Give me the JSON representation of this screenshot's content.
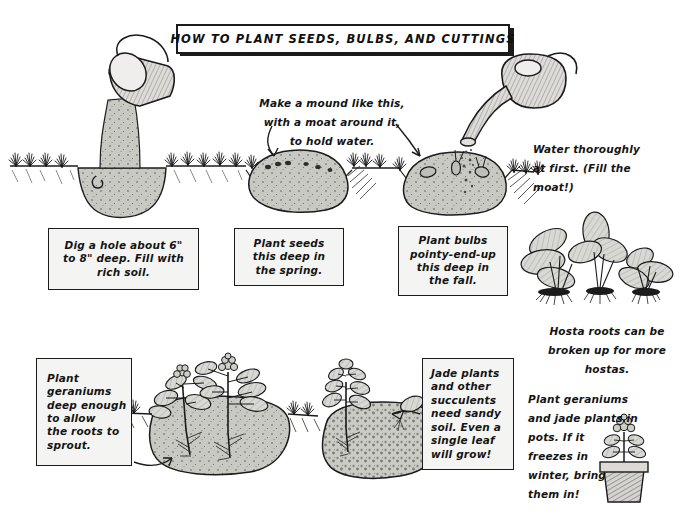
{
  "poster": {
    "title": "HOW TO PLANT SEEDS, BULBS, AND CUTTINGS",
    "background_color": "#ffffff",
    "ink_color": "#141414",
    "soil_color": "#c9c9c4",
    "box_fill": "#f4f4f2"
  },
  "top_row": {
    "captions": [
      {
        "id": "dig-hole",
        "text": "Dig a hole about 6\"\nto 8\" deep. Fill with\nrich soil."
      },
      {
        "id": "plant-seeds",
        "text": "Plant seeds\nthis deep in\nthe spring."
      },
      {
        "id": "plant-bulbs",
        "text": "Plant bulbs\npointy-end-up\nthis deep in\nthe fall."
      }
    ],
    "notes": [
      {
        "id": "make-a-mound",
        "text": "Make a mound like this,\nwith a moat around it,\nto hold water."
      },
      {
        "id": "water-thoroughly",
        "text": "Water thoroughly\nat first. (Fill the\nmoat!)"
      }
    ],
    "illustrations": [
      {
        "id": "bucket-pouring-soil-into-hole",
        "label": "bucket pouring soil into hole"
      },
      {
        "id": "seed-mound-with-moat",
        "label": "mound of soil with seeds and moat"
      },
      {
        "id": "watering-can-over-bulb-mound",
        "label": "watering can watering mound with bulbs"
      },
      {
        "id": "hosta-plants-with-roots",
        "label": "three hosta plants with exposed roots"
      }
    ]
  },
  "bottom_row": {
    "captions": [
      {
        "id": "plant-geraniums-deep",
        "text": "Plant\ngeraniums\ndeep enough\nto allow\nthe roots to\nsprout."
      },
      {
        "id": "jade-sandy-soil",
        "text": "Jade plants\nand other\nsucculents\nneed sandy\nsoil. Even a\nsingle leaf\nwill grow!"
      }
    ],
    "notes": [
      {
        "id": "hosta-roots",
        "text": "Hosta roots can be\nbroken up for more\nhostas."
      },
      {
        "id": "pots-in-winter",
        "text": "Plant geraniums\nand jade plants in\npots. If it\nfreezes in\nwinter, bring\nthem in!"
      }
    ],
    "illustrations": [
      {
        "id": "geraniums-planted-deep",
        "label": "two geranium cuttings planted deep in soil"
      },
      {
        "id": "jade-plant-in-sandy-soil",
        "label": "jade plant and single leaf in sandy soil"
      },
      {
        "id": "geranium-in-terracotta-pot",
        "label": "flowering geranium in a clay pot"
      }
    ]
  }
}
